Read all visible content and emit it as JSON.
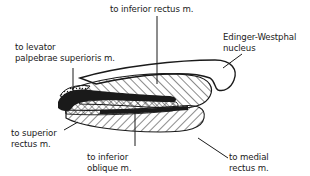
{
  "labels": {
    "inferior_rectus": "to inferior rectus m.",
    "levator_line1": "to levator",
    "levator_line2": "palpebrae superioris m.",
    "edinger_line1": "Edinger-Westphal",
    "edinger_line2": "nucleus",
    "superior_rectus_line1": "to superior",
    "superior_rectus_line2": "rectus m.",
    "inferior_oblique_line1": "to inferior",
    "inferior_oblique_line2": "oblique m.",
    "medial_rectus_line1": "to medial",
    "medial_rectus_line2": "rectus m."
  },
  "colors": {
    "ink": "#1a1a1a",
    "background": "#ffffff"
  }
}
